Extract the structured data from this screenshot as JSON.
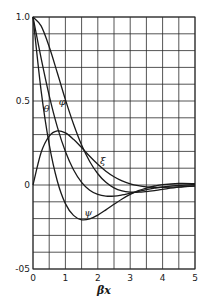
{
  "chart_data": {
    "type": "line",
    "title": "",
    "xlabel": "βx",
    "ylabel": "",
    "xlim": [
      0,
      5
    ],
    "ylim": [
      -0.5,
      1.0
    ],
    "grid": true,
    "x_gridstep": 0.5,
    "y_gridstep": 0.1,
    "x_ticks": [
      0,
      1,
      2,
      3,
      4,
      5
    ],
    "x_tick_labels": [
      "0",
      "1",
      "2",
      "3",
      "4",
      "5"
    ],
    "y_ticks": [
      1.0,
      0.5,
      0,
      -0.5
    ],
    "y_tick_labels": [
      "1.0",
      "0.5",
      "0",
      "-05"
    ],
    "legend": "inline curve labels",
    "x": [
      0,
      0.25,
      0.5,
      0.75,
      1,
      1.25,
      1.5,
      1.75,
      2,
      2.25,
      2.5,
      2.75,
      3,
      3.25,
      3.5,
      3.75,
      4,
      4.5,
      5
    ],
    "series": [
      {
        "name": "φ",
        "label_pos": [
          0.9,
          0.5
        ],
        "values": [
          1,
          0.947,
          0.823,
          0.668,
          0.508,
          0.363,
          0.238,
          0.14,
          0.067,
          0.016,
          -0.017,
          -0.035,
          -0.042,
          -0.043,
          -0.039,
          -0.033,
          -0.026,
          -0.013,
          -0.005
        ]
      },
      {
        "name": "θ",
        "label_pos": [
          0.42,
          0.46
        ],
        "values": [
          1,
          0.755,
          0.532,
          0.346,
          0.199,
          0.091,
          0.016,
          -0.031,
          -0.056,
          -0.066,
          -0.066,
          -0.059,
          -0.049,
          -0.039,
          -0.028,
          -0.019,
          -0.012,
          -0.002,
          0.002
        ]
      },
      {
        "name": "ξ",
        "label_pos": [
          2.15,
          0.15
        ],
        "values": [
          0,
          0.193,
          0.291,
          0.322,
          0.31,
          0.272,
          0.223,
          0.171,
          0.123,
          0.082,
          0.049,
          0.024,
          0.007,
          -0.004,
          -0.011,
          -0.014,
          -0.014,
          -0.011,
          -0.007
        ]
      },
      {
        "name": "ψ",
        "label_pos": [
          1.7,
          -0.16
        ],
        "values": [
          1,
          0.562,
          0.242,
          0.024,
          -0.111,
          -0.181,
          -0.207,
          -0.202,
          -0.179,
          -0.148,
          -0.115,
          -0.083,
          -0.056,
          -0.034,
          -0.018,
          -0.006,
          0.002,
          0.009,
          0.008
        ]
      }
    ]
  },
  "colors": {
    "line": "#1a1a1a",
    "grid": "#2a2a2a",
    "background": "#ffffff"
  }
}
